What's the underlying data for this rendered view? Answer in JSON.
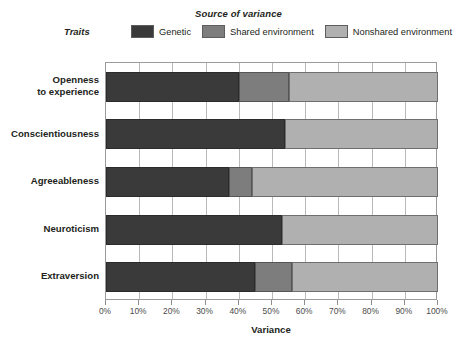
{
  "legend": {
    "title": "Source of variance",
    "traits_label": "Traits",
    "items": [
      {
        "label": "Genetic",
        "color": "#3a3a3a",
        "key": "genetic"
      },
      {
        "label": "Shared environment",
        "color": "#7d7d7d",
        "key": "shared"
      },
      {
        "label": "Nonshared environment",
        "color": "#b0b0b0",
        "key": "nonshared"
      }
    ]
  },
  "axis": {
    "x_title": "Variance",
    "x_ticks": [
      "0%",
      "10%",
      "20%",
      "30%",
      "40%",
      "50%",
      "60%",
      "70%",
      "80%",
      "90%",
      "100%"
    ]
  },
  "chart_data": {
    "type": "bar",
    "orientation": "horizontal",
    "stacked": true,
    "title": "Source of variance",
    "xlabel": "Variance",
    "ylabel": "Traits",
    "xlim": [
      0,
      100
    ],
    "grid": true,
    "legend_position": "top",
    "categories": [
      "Openness to experience",
      "Conscientiousness",
      "Agreeableness",
      "Neuroticism",
      "Extraversion"
    ],
    "category_lines": [
      [
        "Openness",
        "to experience"
      ],
      [
        "Conscientiousness"
      ],
      [
        "Agreeableness"
      ],
      [
        "Neuroticism"
      ],
      [
        "Extraversion"
      ]
    ],
    "series": [
      {
        "name": "Genetic",
        "color": "#3a3a3a",
        "values": [
          40,
          54,
          37,
          53,
          45
        ]
      },
      {
        "name": "Shared environment",
        "color": "#7d7d7d",
        "values": [
          15,
          0,
          7,
          0,
          11
        ]
      },
      {
        "name": "Nonshared environment",
        "color": "#b0b0b0",
        "values": [
          45,
          46,
          56,
          47,
          44
        ]
      }
    ]
  }
}
